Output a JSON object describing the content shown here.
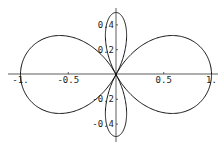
{
  "chart_data": {
    "type": "line",
    "subtype": "polar-parametric",
    "title": "",
    "xlabel": "",
    "ylabel": "",
    "xlim": [
      -1,
      1
    ],
    "ylim": [
      -0.5,
      0.5
    ],
    "grid": false,
    "legend": null,
    "curve": "r = 0.75*cos(2θ) + 0.25 (estimated fit)",
    "x_ticks": [
      "-1.",
      "-0.5",
      "0.5",
      "1."
    ],
    "x_tick_values": [
      -1,
      -0.5,
      0.5,
      1
    ],
    "y_ticks": [
      "0.4",
      "0.2",
      "-0.2",
      "-0.4"
    ],
    "y_tick_values": [
      0.4,
      0.2,
      -0.2,
      -0.4
    ],
    "series": [
      {
        "name": "curve",
        "color": "#111111",
        "key_points": [
          {
            "x": 1.0,
            "y": 0.0
          },
          {
            "x": 0.54,
            "y": 0.31
          },
          {
            "x": 0.0,
            "y": 0.0
          },
          {
            "x": -0.54,
            "y": 0.31
          },
          {
            "x": -1.0,
            "y": 0.0
          },
          {
            "x": 0.0,
            "y": 0.5
          },
          {
            "x": 0.0,
            "y": -0.5
          }
        ]
      }
    ]
  }
}
